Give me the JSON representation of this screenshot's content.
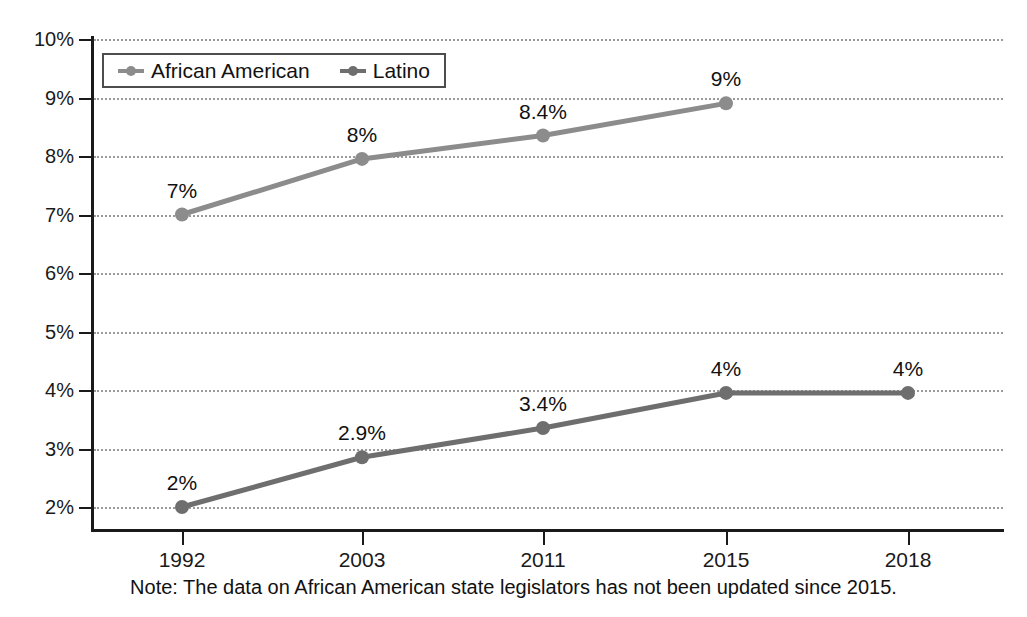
{
  "chart_data": {
    "type": "line",
    "title": "",
    "xlabel": "",
    "ylabel": "",
    "categories": [
      "1992",
      "2003",
      "2011",
      "2015",
      "2018"
    ],
    "ylim": [
      2,
      10
    ],
    "y_ticks": [
      "2%",
      "3%",
      "4%",
      "5%",
      "6%",
      "7%",
      "8%",
      "9%",
      "10%"
    ],
    "y_tick_values": [
      2,
      3,
      4,
      5,
      6,
      7,
      8,
      9,
      10
    ],
    "grid": true,
    "legend_position": "top-left",
    "series": [
      {
        "name": "African American",
        "color": "#8c8c8c",
        "x": [
          "1992",
          "2003",
          "2011",
          "2015"
        ],
        "values": [
          7.0,
          7.95,
          8.35,
          8.9
        ],
        "labels": [
          "7%",
          "8%",
          "8.4%",
          "9%"
        ]
      },
      {
        "name": "Latino",
        "color": "#6e6e6e",
        "x": [
          "1992",
          "2003",
          "2011",
          "2015",
          "2018"
        ],
        "values": [
          2.0,
          2.85,
          3.35,
          3.95,
          3.95
        ],
        "labels": [
          "2%",
          "2.9%",
          "3.4%",
          "4%",
          "4%"
        ]
      }
    ],
    "annotations": [
      "Note: The data on African American state legislators has not been updated since 2015."
    ]
  },
  "legend": {
    "items": [
      {
        "label": "African American",
        "marker": "line-marker-icon"
      },
      {
        "label": "Latino",
        "marker": "line-marker-icon"
      }
    ]
  },
  "note": {
    "text": "Note: The data on African American state legislators has not been updated since 2015."
  },
  "colors": {
    "african_american": "#8c8c8c",
    "latino": "#6e6e6e",
    "axis": "#1a1a1a",
    "grid": "#9a9a9a",
    "text": "#111111",
    "background": "#ffffff"
  }
}
